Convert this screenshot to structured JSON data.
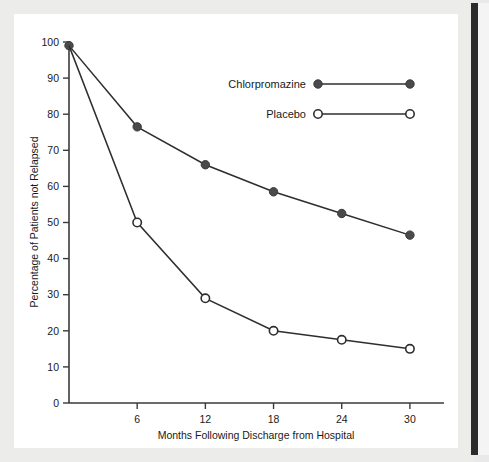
{
  "figure": {
    "background_color": "#ececeb",
    "panel_color": "#ffffff",
    "accent_bar_color": "#2b2b2b"
  },
  "chart_data": {
    "type": "line",
    "title": "",
    "xlabel": "Months Following Discharge from Hospital",
    "ylabel": "Percentage of Patients not Relapsed",
    "x": [
      0,
      6,
      12,
      18,
      24,
      30
    ],
    "xticks": [
      6,
      12,
      18,
      24,
      30
    ],
    "xticklabels": [
      "6",
      "12",
      "18",
      "24",
      "30"
    ],
    "xlim": [
      0,
      33
    ],
    "yticks": [
      0,
      10,
      20,
      30,
      40,
      50,
      60,
      70,
      80,
      90,
      100
    ],
    "yticklabels": [
      "0",
      "10",
      "20",
      "30",
      "40",
      "50",
      "60",
      "70",
      "80",
      "90",
      "100"
    ],
    "ylim": [
      0,
      100
    ],
    "grid": false,
    "legend_position": "upper right",
    "series": [
      {
        "name": "Chlorpromazine",
        "marker": "filled-circle",
        "color": "#4a4a4a",
        "values": [
          99,
          76.5,
          66,
          58.5,
          52.5,
          46.5
        ]
      },
      {
        "name": "Placebo",
        "marker": "open-circle",
        "color": "#ffffff",
        "values": [
          99,
          50,
          29,
          20,
          17.5,
          15
        ]
      }
    ]
  },
  "legend": {
    "entries": [
      {
        "label": "Chlorpromazine",
        "marker": "filled-circle"
      },
      {
        "label": "Placebo",
        "marker": "open-circle"
      }
    ]
  }
}
